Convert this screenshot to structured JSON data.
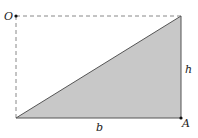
{
  "diagram": {
    "labels": {
      "origin": "O",
      "corner": "A",
      "height": "h",
      "base": "b"
    },
    "colors": {
      "fill": "#c8c8c8",
      "stroke": "#555555",
      "dashed": "#888888"
    },
    "points": {
      "O": [
        16,
        16
      ],
      "top_right": [
        181,
        16
      ],
      "bottom_left": [
        16,
        118
      ],
      "A": [
        181,
        118
      ]
    }
  }
}
